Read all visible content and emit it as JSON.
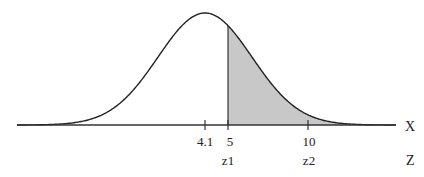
{
  "chart_data": {
    "type": "area",
    "title": "",
    "distribution": {
      "mean": 4.1
    },
    "axes": {
      "x": {
        "label": "X",
        "ticks": [
          4.1,
          5,
          10
        ],
        "tick_labels": [
          "4.1",
          "5",
          "10"
        ]
      },
      "z": {
        "label": "Z",
        "tick_labels": [
          "z1",
          "z2"
        ],
        "positions": [
          5,
          10
        ]
      }
    },
    "shaded_region": {
      "from": 5,
      "to": "right tail",
      "color": "#c8c8c8"
    },
    "curve_color": "#222222"
  },
  "labels": {
    "x_axis": "X",
    "z_axis": "Z",
    "tick_mean": "4.1",
    "tick_5": "5",
    "tick_10": "10",
    "z1": "z1",
    "z2": "z2"
  },
  "colors": {
    "shade": "#c8c8c8",
    "line": "#222222",
    "background": "#ffffff"
  }
}
